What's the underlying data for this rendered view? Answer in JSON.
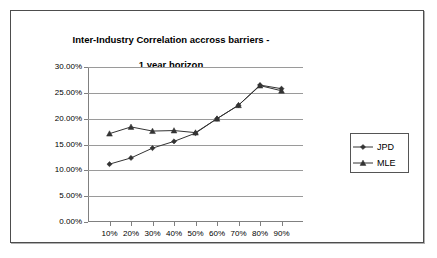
{
  "chart_data": {
    "type": "line",
    "title": "Inter-Industry Correlation accross barriers -\n1 year horizon",
    "title_line1": "Inter-Industry Correlation accross barriers -",
    "title_line2": "1 year horizon",
    "xlabel": "",
    "ylabel": "",
    "categories": [
      "10%",
      "20%",
      "30%",
      "40%",
      "50%",
      "60%",
      "70%",
      "80%",
      "90%"
    ],
    "x_values": [
      10,
      20,
      30,
      40,
      50,
      60,
      70,
      80,
      90
    ],
    "ylim": [
      0,
      30
    ],
    "y_ticks": [
      0,
      5,
      10,
      15,
      20,
      25,
      30
    ],
    "y_tick_labels": [
      "0.00%",
      "5.00%",
      "10.00%",
      "15.00%",
      "20.00%",
      "25.00%",
      "30.00%"
    ],
    "grid": true,
    "legend_position": "right",
    "series": [
      {
        "name": "JPD",
        "marker": "diamond",
        "color": "#333333",
        "values": [
          11.2,
          12.4,
          14.3,
          15.6,
          17.2,
          20.0,
          22.6,
          26.5,
          25.8
        ]
      },
      {
        "name": "MLE",
        "marker": "triangle",
        "color": "#333333",
        "values": [
          17.1,
          18.4,
          17.6,
          17.7,
          17.3,
          20.0,
          22.6,
          26.4,
          25.4
        ]
      }
    ]
  },
  "legend": {
    "items": [
      {
        "label": "JPD",
        "marker": "diamond"
      },
      {
        "label": "MLE",
        "marker": "triangle"
      }
    ]
  },
  "colors": {
    "frame_border": "#4d4d4d",
    "gridline": "#9a9a9a",
    "axis": "#808080",
    "series": "#333333",
    "background": "#ffffff"
  }
}
